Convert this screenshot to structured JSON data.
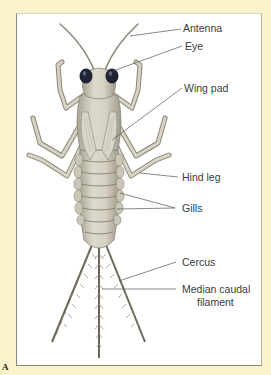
{
  "figure": {
    "panel_letter": "A",
    "background_color": "#fbf3c9",
    "frame_color": "#ffffff"
  },
  "labels": {
    "antenna": "Antenna",
    "eye": "Eye",
    "wing_pad": "Wing pad",
    "hind_leg": "Hind leg",
    "gills": "Gills",
    "cercus": "Cercus",
    "median_caudal_filament_line1": "Median caudal",
    "median_caudal_filament_line2": "filament"
  },
  "colors": {
    "body": "#cfcbbd",
    "body_shade": "#a9a496",
    "eye": "#1e2433",
    "leader_line": "#555555"
  }
}
